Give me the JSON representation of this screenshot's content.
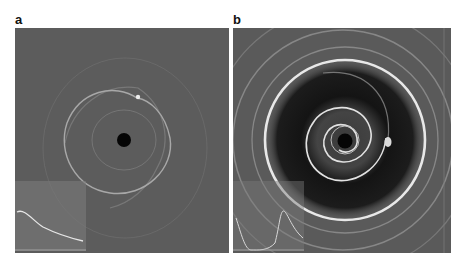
{
  "figure": {
    "panels": [
      {
        "label": "a",
        "description": "Simulated disk image with faint single spiral arm around a central hole and a bright point source; inset shows a monotonically declining radial profile",
        "background_color": "#5c5c5c",
        "inset": {
          "profile": "decreasing"
        }
      },
      {
        "label": "b",
        "description": "Simulated disk image with multiple bright concentric rings, a dark gap, a tightly wound inner spiral around a central hole, and a bright clump; inset shows a double-peaked radial profile",
        "background_color": "#5a5a5a",
        "inset": {
          "profile": "double-peaked"
        }
      }
    ]
  }
}
